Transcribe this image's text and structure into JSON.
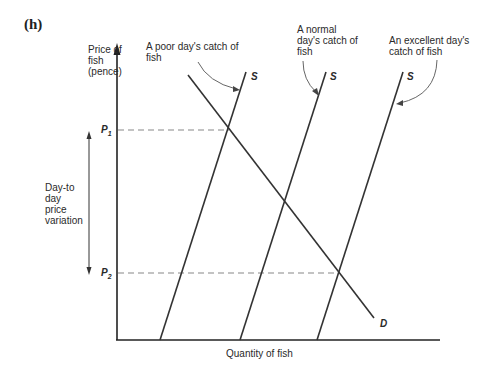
{
  "panel_label": "(h)",
  "y_axis_label": [
    "Price of",
    "fish",
    "(pence)"
  ],
  "x_axis_label": "Quantity of fish",
  "price_labels": {
    "p1": "P",
    "p1_sub": "1",
    "p2": "P",
    "p2_sub": "2"
  },
  "variation_label": [
    "Day-to",
    "day",
    "price",
    "variation"
  ],
  "annotations": {
    "poor": [
      "A poor day's catch of",
      "fish"
    ],
    "normal": [
      "A normal",
      "day's catch of",
      "fish"
    ],
    "excellent": [
      "An excellent day's",
      "catch of fish"
    ]
  },
  "curve_labels": {
    "supply": "S",
    "demand": "D"
  },
  "colors": {
    "line": "#333333",
    "dashed": "#888888",
    "arrow": "#555555"
  }
}
